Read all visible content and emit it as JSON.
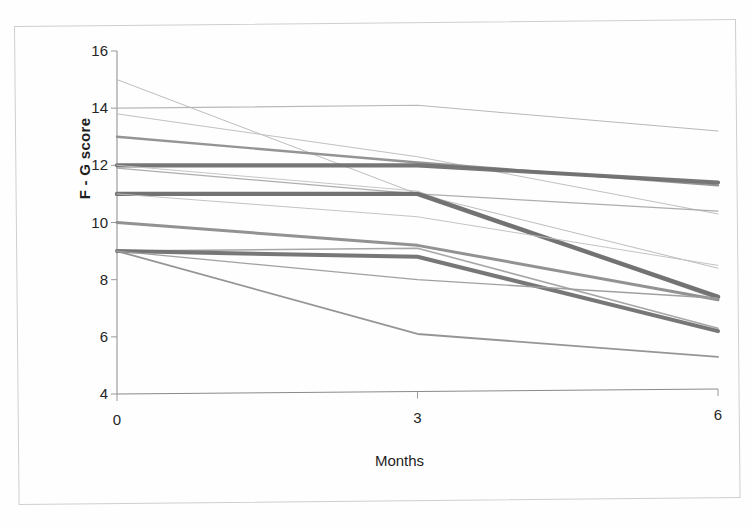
{
  "figure": {
    "xlabel": "Months",
    "ylabel": "F - G score"
  },
  "chart_data": {
    "type": "line",
    "title": "",
    "subtitle": "",
    "xlabel": "Months",
    "ylabel": "F - G score",
    "x": [
      0,
      3,
      6
    ],
    "xticklabels": [
      "0",
      "3",
      "6"
    ],
    "yticklabels": [
      "4",
      "6",
      "8",
      "10",
      "12",
      "14",
      "16"
    ],
    "xlim": [
      0,
      6
    ],
    "ylim": [
      4,
      16
    ],
    "ytick_step": 2,
    "grid": false,
    "legend": "none",
    "annotations": [],
    "series": [
      {
        "name": "subject-01",
        "values": [
          15.0,
          11.0,
          8.4
        ],
        "color": "#b9b9b9",
        "width": 1.0
      },
      {
        "name": "subject-02",
        "values": [
          14.0,
          14.1,
          13.2
        ],
        "color": "#b4b4b4",
        "width": 1.1
      },
      {
        "name": "subject-03",
        "values": [
          13.8,
          12.3,
          10.3
        ],
        "color": "#bdbdbd",
        "width": 1.0
      },
      {
        "name": "subject-04",
        "values": [
          13.0,
          12.1,
          11.3
        ],
        "color": "#8e8e8e",
        "width": 2.4
      },
      {
        "name": "subject-05",
        "values": [
          12.0,
          12.0,
          11.4
        ],
        "color": "#6f6f6f",
        "width": 4.2
      },
      {
        "name": "subject-06",
        "values": [
          12.0,
          11.1,
          7.3
        ],
        "color": "#c3c3c3",
        "width": 1.0
      },
      {
        "name": "subject-07",
        "values": [
          11.9,
          11.0,
          10.4
        ],
        "color": "#a9a9a9",
        "width": 1.2
      },
      {
        "name": "subject-08",
        "values": [
          11.0,
          11.0,
          7.4
        ],
        "color": "#6b6b6b",
        "width": 4.4
      },
      {
        "name": "subject-09",
        "values": [
          11.0,
          10.2,
          8.5
        ],
        "color": "#c0c0c0",
        "width": 1.0
      },
      {
        "name": "subject-10",
        "values": [
          10.0,
          9.2,
          7.3
        ],
        "color": "#8c8c8c",
        "width": 3.0
      },
      {
        "name": "subject-11",
        "values": [
          9.0,
          9.1,
          6.3
        ],
        "color": "#a2a2a2",
        "width": 1.6
      },
      {
        "name": "subject-12",
        "values": [
          9.0,
          8.8,
          6.2
        ],
        "color": "#707070",
        "width": 4.0
      },
      {
        "name": "subject-13",
        "values": [
          9.0,
          6.1,
          5.3
        ],
        "color": "#8f8f8f",
        "width": 1.8
      },
      {
        "name": "subject-14",
        "values": [
          9.0,
          8.0,
          7.35
        ],
        "color": "#9b9b9b",
        "width": 1.3
      }
    ]
  },
  "plot_geometry": {
    "left": 117,
    "right": 718,
    "top": 51,
    "bottom": 394
  },
  "colors": {
    "axis": "#8a8a8a",
    "text": "#1e1e1e",
    "frame": "#cfcfcf",
    "paper": "#ffffff"
  }
}
